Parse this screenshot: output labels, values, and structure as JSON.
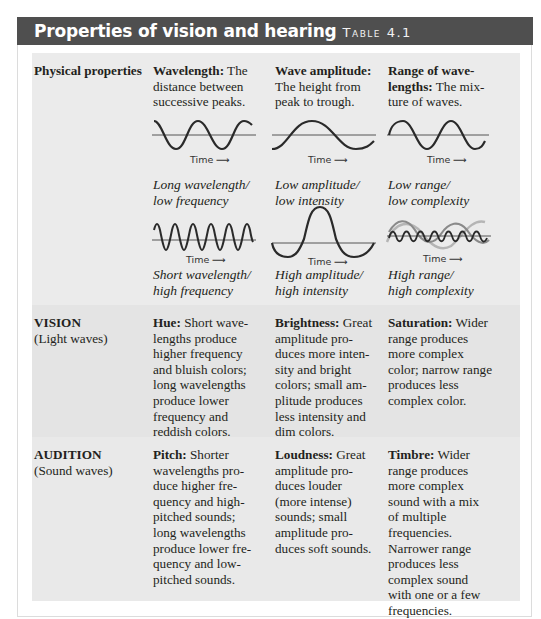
{
  "header": {
    "title": "Properties of vision and hearing",
    "table_label": "Table 4.1"
  },
  "rows": [
    {
      "label_bold": "Physical properties",
      "label_sub": "",
      "cells": [
        {
          "term": "Wavelength:",
          "text": " The distance between successive peaks."
        },
        {
          "term": "Wave amplitude:",
          "text": " The height from peak to trough."
        },
        {
          "term": "Range of wave-lengths:",
          "text": " The mix-ture of waves."
        }
      ]
    },
    {
      "label_bold": "VISION",
      "label_sub": "(Light waves)",
      "cells": [
        {
          "term": "Hue:",
          "text": " Short wave-lengths produce higher frequency and bluish colors; long wavelengths produce lower frequency and reddish colors."
        },
        {
          "term": "Brightness:",
          "text": " Great amplitude pro-duces more inten-sity and bright colors; small am-plitude produces less intensity and dim colors."
        },
        {
          "term": "Saturation:",
          "text": " Wider range produces more complex color; narrow range produces less complex color."
        }
      ]
    },
    {
      "label_bold": "AUDITION",
      "label_sub": "(Sound waves)",
      "cells": [
        {
          "term": "Pitch:",
          "text": " Shorter wavelengths pro-duce higher fre-quency and high-pitched sounds; long wavelengths produce lower fre-quency and low-pitched sounds."
        },
        {
          "term": "Loudness:",
          "text": " Great amplitude pro-duces louder (more intense) sounds; small amplitude pro-duces soft sounds."
        },
        {
          "term": "Timbre:",
          "text": " Wider range produces more complex sound with a mix of multiple frequencies. Narrower range produces less complex sound with one or a few frequencies."
        }
      ]
    }
  ],
  "diagrams": {
    "axis_label": "Time",
    "arrow": "→",
    "captions": {
      "long_wavelength": [
        "Long wavelength/",
        "low frequency"
      ],
      "short_wavelength": [
        "Short wavelength/",
        "high frequency"
      ],
      "low_amplitude": [
        "Low amplitude/",
        "low intensity"
      ],
      "high_amplitude": [
        "High amplitude/",
        "high intensity"
      ],
      "low_range": [
        "Low range/",
        "low complexity"
      ],
      "high_range": [
        "High range/",
        "high complexity"
      ]
    }
  },
  "colors": {
    "header_bg": "#4f4f4f",
    "panel_bg": "#ebebeb",
    "wave_dark": "#2a2a2a",
    "wave_mid": "#8a8a8a",
    "wave_light": "#b5b5b5"
  }
}
